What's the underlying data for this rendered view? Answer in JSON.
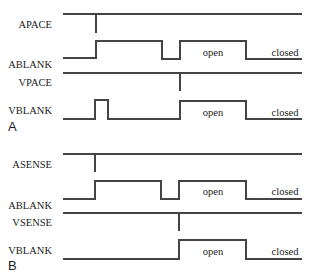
{
  "diagram": {
    "stroke_color": "#444444",
    "text_color": "#1a1a1a",
    "x_start": 63,
    "x_end": 302,
    "panels": [
      {
        "label": "A",
        "label_pos": [
          8,
          131
        ],
        "signals": [
          {
            "name": "APACE",
            "label_right": 52,
            "label_y": 28,
            "path": "M63,14 L302,14 M96,14 L96,33",
            "states": []
          },
          {
            "name": "ABLANK",
            "label_right": 52,
            "label_y": 68,
            "path": "M63,58 L96,58 L96,41 L162,41 L162,59 L180,59 L180,41 L246,41 L246,59 L302,59",
            "states": [
              {
                "text": "open",
                "x": 213,
                "y": 56
              },
              {
                "text": "closed",
                "x": 285,
                "y": 56
              }
            ]
          },
          {
            "name": "VPACE",
            "label_right": 52,
            "label_y": 86,
            "path": "M63,73 L302,73 M180,73 L180,91",
            "states": []
          },
          {
            "name": "VBLANK",
            "label_right": 52,
            "label_y": 114,
            "path": "M63,119 L95,119 L95,100 L108,100 L108,119 L180,119 L180,101 L246,101 L246,119 L302,119",
            "states": [
              {
                "text": "open",
                "x": 213,
                "y": 116
              },
              {
                "text": "closed",
                "x": 285,
                "y": 116
              }
            ]
          }
        ]
      },
      {
        "label": "B",
        "label_pos": [
          8,
          270
        ],
        "signals": [
          {
            "name": "ASENSE",
            "label_right": 52,
            "label_y": 168,
            "path": "M63,154 L302,154 M95,154 L95,172",
            "states": []
          },
          {
            "name": "ABLANK",
            "label_right": 52,
            "label_y": 209,
            "path": "M63,199 L95,199 L95,181 L161,181 L161,199 L179,199 L179,181 L246,181 L246,199 L302,199",
            "states": [
              {
                "text": "open",
                "x": 213,
                "y": 195
              },
              {
                "text": "closed",
                "x": 285,
                "y": 195
              }
            ]
          },
          {
            "name": "VSENSE",
            "label_right": 52,
            "label_y": 226,
            "path": "M63,213 L302,213 M179,213 L179,231",
            "states": []
          },
          {
            "name": "VBLANK",
            "label_right": 52,
            "label_y": 254,
            "path": "M63,259 L179,259 L179,240 L246,240 L246,259 L302,259",
            "states": [
              {
                "text": "open",
                "x": 213,
                "y": 255
              },
              {
                "text": "closed",
                "x": 285,
                "y": 255
              }
            ]
          }
        ]
      }
    ]
  }
}
